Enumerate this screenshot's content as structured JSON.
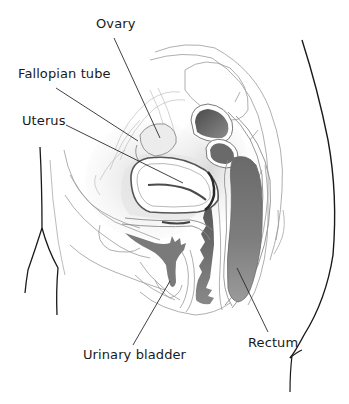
{
  "diagram": {
    "type": "anatomical-cross-section",
    "labels": [
      {
        "id": "ovary",
        "text": "Ovary",
        "x": 96,
        "y": 17,
        "pointer_from": [
          114,
          38
        ],
        "pointer_to": [
          160,
          138
        ]
      },
      {
        "id": "fallopian-tube",
        "text": "Fallopian tube",
        "x": 18,
        "y": 67,
        "pointer_from": [
          56,
          88
        ],
        "pointer_to": [
          138,
          141
        ]
      },
      {
        "id": "uterus",
        "text": "Uterus",
        "x": 22,
        "y": 115,
        "pointer_from": [
          66,
          125
        ],
        "pointer_to": [
          183,
          183
        ]
      },
      {
        "id": "urinary-bladder",
        "text": "Urinary bladder",
        "x": 83,
        "y": 348,
        "pointer_from": [
          133,
          345
        ],
        "pointer_to": [
          170,
          281
        ]
      },
      {
        "id": "rectum",
        "text": "Rectum",
        "x": 248,
        "y": 338,
        "pointer_from": [
          268,
          332
        ],
        "pointer_to": [
          237,
          268
        ]
      }
    ]
  }
}
